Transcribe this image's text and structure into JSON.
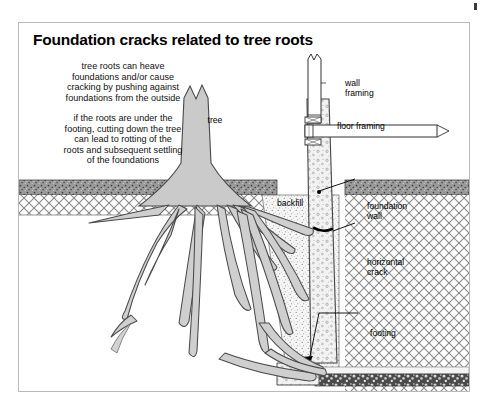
{
  "diagram": {
    "title": "Foundation cracks related to tree roots",
    "notes": [
      {
        "id": "note-heave",
        "text": "tree roots can heave\nfoundations and/or cause\ncracking by pushing against\nfoundations from the outside"
      },
      {
        "id": "note-settling",
        "text": "if the roots are under the\nfooting, cutting down the tree\ncan lead to rotting of the\nroots and subsequent settling\nof the foundations"
      }
    ],
    "labels": {
      "tree": "tree",
      "wall_framing": "wall\nframing",
      "floor_framing": "floor framing",
      "backfill": "backfill",
      "foundation_wall": "foundation\nwall",
      "horizontal_crack": "horizontal\ncrack",
      "footing": "footing"
    },
    "colors": {
      "frame_border": "#b9b9bd",
      "background": "#ffffff",
      "tree_fill": "#c9c9c9",
      "root_fill": "#cfcfcf",
      "topsoil": "#8d8d8d",
      "subsoil_hatch": "#7d7d7d",
      "concrete": "#efefef",
      "gravel": "#555555",
      "text": "#000000"
    }
  }
}
